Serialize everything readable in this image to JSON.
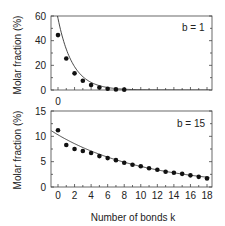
{
  "chart_data": [
    {
      "type": "scatter",
      "panel": "top",
      "annotation": "b = 1",
      "ylabel": "Molar fraction (%)",
      "xlabel": "",
      "ylim": [
        0,
        60
      ],
      "yticks": [
        0,
        20,
        40,
        60
      ],
      "xlim": [
        -0.8,
        19.2
      ],
      "xtick_labels": [
        "0"
      ],
      "grid": false,
      "series": [
        {
          "name": "data",
          "x": [
            0,
            1,
            2,
            3,
            4,
            5,
            6,
            7,
            8
          ],
          "values": [
            44.5,
            25.5,
            13.5,
            7.5,
            4,
            2,
            1,
            0.5,
            0.3
          ]
        },
        {
          "name": "fit",
          "style": "line",
          "model": "exponential",
          "y0": 58,
          "decay": 0.56
        }
      ]
    },
    {
      "type": "scatter",
      "panel": "bottom",
      "annotation": "b = 15",
      "ylabel": "Molar fraction (%)",
      "xlabel": "Number of bonds k",
      "ylim": [
        0,
        15
      ],
      "yticks": [
        0,
        5,
        10,
        15
      ],
      "xlim": [
        -0.8,
        19.2
      ],
      "xticks": [
        0,
        2,
        4,
        6,
        8,
        10,
        12,
        14,
        16,
        18
      ],
      "grid": false,
      "series": [
        {
          "name": "data",
          "x": [
            0,
            1,
            2,
            3,
            4,
            5,
            6,
            7,
            8,
            9,
            10,
            11,
            12,
            13,
            14,
            15,
            16,
            17,
            18
          ],
          "values": [
            11.2,
            8.3,
            7.5,
            7.1,
            6.7,
            6.1,
            5.7,
            5.3,
            4.8,
            4.4,
            4.1,
            3.7,
            3.4,
            3.0,
            2.8,
            2.6,
            2.3,
            2.0,
            1.7
          ]
        },
        {
          "name": "fit",
          "style": "line",
          "model": "exponential",
          "y0": 10.3,
          "decay": 0.093
        }
      ]
    }
  ],
  "labels": {
    "top_annotation": "b = 1",
    "bottom_annotation": "b = 15",
    "ylabel_top": "Molar fraction (%)",
    "ylabel_bottom": "Molar fraction (%)",
    "xlabel": "Number of bonds k",
    "top_xtick": "0"
  },
  "colors": {
    "axis": "#444444",
    "marker": "#111111",
    "line": "#333333"
  }
}
